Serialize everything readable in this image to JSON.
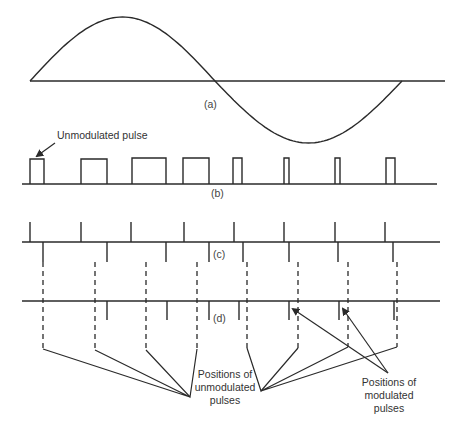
{
  "figure": {
    "colors": {
      "line": "#2a2a2a",
      "text": "#333333",
      "background": "#ffffff"
    }
  },
  "panel_a": {
    "caption": "(a)",
    "signal": "sine-wave",
    "axis": {
      "x1": 30,
      "x2": 445,
      "y": 81
    },
    "wave": {
      "x_start": 30,
      "x_cross": 215,
      "x_end": 402,
      "peak_y": 17,
      "trough_y": 143
    }
  },
  "panel_b": {
    "caption": "(b)",
    "annotation": "Unmodulated pulse",
    "baseline": {
      "x1": 22,
      "x2": 437,
      "y": 184
    },
    "pulses": [
      {
        "x": 30,
        "w": 14,
        "top": 159
      },
      {
        "x": 81,
        "w": 26,
        "top": 159
      },
      {
        "x": 132,
        "w": 34,
        "top": 158
      },
      {
        "x": 183,
        "w": 26,
        "top": 158
      },
      {
        "x": 233,
        "w": 9,
        "top": 158
      },
      {
        "x": 284,
        "w": 5,
        "top": 158
      },
      {
        "x": 335,
        "w": 5,
        "top": 158
      },
      {
        "x": 386,
        "w": 9,
        "top": 158
      }
    ]
  },
  "panel_c": {
    "caption": "(c)",
    "baseline": {
      "x1": 22,
      "x2": 440,
      "y": 242
    },
    "up_ticks": [
      30,
      81,
      131,
      184,
      234,
      284,
      335,
      385
    ],
    "down_ticks": [
      43,
      107,
      166,
      209,
      243,
      289,
      338,
      393
    ],
    "up_top": 222,
    "down_bottom": 262
  },
  "panel_d": {
    "caption": "(d)",
    "baseline": {
      "x1": 22,
      "x2": 440,
      "y": 301
    },
    "down_ticks": [
      107,
      167,
      209,
      239,
      289,
      339,
      394
    ],
    "tick_bottom": 320,
    "dashed_lines": [
      {
        "x": 43,
        "y1": 262,
        "y2": 349
      },
      {
        "x": 95,
        "y1": 262,
        "y2": 350
      },
      {
        "x": 146,
        "y1": 262,
        "y2": 350
      },
      {
        "x": 197,
        "y1": 262,
        "y2": 349
      },
      {
        "x": 247,
        "y1": 262,
        "y2": 348
      },
      {
        "x": 298,
        "y1": 262,
        "y2": 348
      },
      {
        "x": 348,
        "y1": 262,
        "y2": 347
      },
      {
        "x": 397,
        "y1": 262,
        "y2": 347
      }
    ]
  },
  "annotations": {
    "unmodulated_positions": {
      "lines": [
        "Positions of",
        "unmodulated",
        "pulses"
      ],
      "center_x": 225,
      "line_ys": [
        378,
        391,
        404
      ]
    },
    "modulated_positions": {
      "lines": [
        "Positions of",
        "modulated",
        "pulses"
      ],
      "center_x": 389,
      "line_ys": [
        386,
        399,
        412
      ]
    }
  }
}
